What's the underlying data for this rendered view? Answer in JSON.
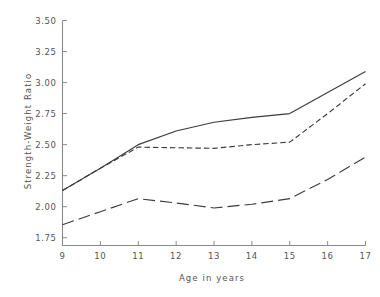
{
  "chart_data": {
    "type": "line",
    "title": "",
    "xlabel": "Age in years",
    "ylabel": "Strength-Weight Ratio",
    "x": [
      9,
      10,
      11,
      12,
      13,
      14,
      15,
      16,
      17
    ],
    "xlim": [
      9,
      17
    ],
    "ylim": [
      1.6875,
      3.5
    ],
    "xticks": [
      9,
      10,
      11,
      12,
      13,
      14,
      15,
      16,
      17
    ],
    "xticklabels": [
      "9",
      "10",
      "11",
      "12",
      "13",
      "14",
      "15",
      "16",
      "17"
    ],
    "yticks": [
      1.75,
      2.0,
      2.25,
      2.5,
      2.75,
      3.0,
      3.25,
      3.5
    ],
    "yticklabels": [
      "1.75",
      "2.00",
      "2.25",
      "2.50",
      "2.75",
      "3.00",
      "3.25",
      "3.50"
    ],
    "grid": false,
    "legend": "none",
    "series": [
      {
        "name": "upper-solid",
        "style": "solid",
        "color": "#3c3c3c",
        "values": [
          2.13,
          2.31,
          2.5,
          2.61,
          2.68,
          2.72,
          2.75,
          2.92,
          3.09
        ]
      },
      {
        "name": "middle-short-dash",
        "style": "short-dash",
        "color": "#3c3c3c",
        "values": [
          2.13,
          2.31,
          2.48,
          2.475,
          2.47,
          2.5,
          2.52,
          2.75,
          2.99
        ]
      },
      {
        "name": "lower-long-dash",
        "style": "long-dash",
        "color": "#3c3c3c",
        "values": [
          1.855,
          1.96,
          2.065,
          2.03,
          1.99,
          2.02,
          2.065,
          2.22,
          2.4
        ]
      }
    ]
  },
  "axes": {
    "x_title": "Age in years",
    "y_title": "Strength-Weight Ratio"
  }
}
